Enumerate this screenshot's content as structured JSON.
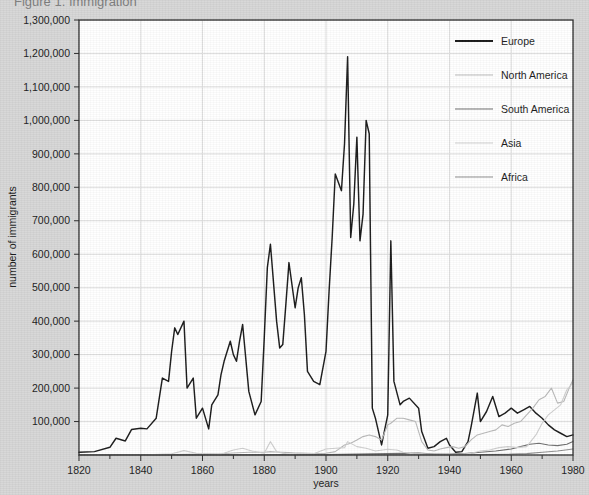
{
  "figure": {
    "clipped_title": "Figure 1.  Immigration",
    "background_color": "#d6d6d6",
    "plot_background_color": "#ffffff",
    "grid_color": "#dcdcdc",
    "axis_color": "#2b2b2b"
  },
  "axes": {
    "x": {
      "label": "years",
      "min": 1820,
      "max": 1980,
      "major_step": 20,
      "minor_step": 10,
      "ticks": [
        1820,
        1840,
        1860,
        1880,
        1900,
        1920,
        1940,
        1960,
        1980
      ],
      "tick_labels": [
        "1820",
        "1840",
        "1860",
        "1880",
        "1900",
        "1920",
        "1940",
        "1960",
        "1980"
      ]
    },
    "y": {
      "label": "number of immigrants",
      "min": 0,
      "max": 1300000,
      "step": 100000,
      "ticks": [
        100000,
        200000,
        300000,
        400000,
        500000,
        600000,
        700000,
        800000,
        900000,
        1000000,
        1100000,
        1200000,
        1300000
      ],
      "tick_labels": [
        "100,000",
        "200,000",
        "300,000",
        "400,000",
        "500,000",
        "600,000",
        "700,000",
        "800,000",
        "900,000",
        "1,000,000",
        "1,100,000",
        "1,200,000",
        "1,300,000"
      ]
    }
  },
  "legend": {
    "position": "top-right-inside",
    "items": [
      {
        "label": "Europe",
        "color": "#1a1a1a",
        "width": 2.1
      },
      {
        "label": "North America",
        "color": "#b9b9b9",
        "width": 1.2
      },
      {
        "label": "South America",
        "color": "#6e6e6e",
        "width": 1.2
      },
      {
        "label": "Asia",
        "color": "#cfcfcf",
        "width": 1.2
      },
      {
        "label": "Africa",
        "color": "#8e8e8e",
        "width": 1.2
      }
    ]
  },
  "chart_data": {
    "type": "line",
    "title": "Figure 1.  Immigration",
    "xlabel": "years",
    "ylabel": "number of immigrants",
    "xlim": [
      1820,
      1980
    ],
    "ylim": [
      0,
      1300000
    ],
    "grid": true,
    "legend_position": "top-right-inside",
    "series": [
      {
        "name": "Europe",
        "color": "#1a1a1a",
        "x": [
          1820,
          1825,
          1830,
          1832,
          1835,
          1837,
          1840,
          1842,
          1845,
          1847,
          1849,
          1850,
          1851,
          1852,
          1854,
          1855,
          1857,
          1858,
          1860,
          1862,
          1863,
          1865,
          1866,
          1867,
          1869,
          1870,
          1871,
          1872,
          1873,
          1875,
          1877,
          1879,
          1880,
          1881,
          1882,
          1884,
          1885,
          1886,
          1887,
          1888,
          1890,
          1891,
          1892,
          1893,
          1894,
          1896,
          1898,
          1900,
          1901,
          1902,
          1903,
          1905,
          1906,
          1907,
          1908,
          1909,
          1910,
          1911,
          1912,
          1913,
          1914,
          1915,
          1916,
          1918,
          1920,
          1921,
          1922,
          1924,
          1925,
          1927,
          1930,
          1931,
          1933,
          1935,
          1937,
          1939,
          1940,
          1942,
          1944,
          1946,
          1947,
          1949,
          1950,
          1952,
          1954,
          1956,
          1958,
          1960,
          1962,
          1964,
          1966,
          1968,
          1970,
          1972,
          1974,
          1976,
          1978,
          1980
        ],
        "y": [
          8000,
          10000,
          23000,
          50000,
          42000,
          76000,
          80000,
          78000,
          110000,
          230000,
          220000,
          310000,
          380000,
          360000,
          400000,
          200000,
          230000,
          110000,
          140000,
          78000,
          150000,
          180000,
          240000,
          280000,
          340000,
          300000,
          280000,
          340000,
          390000,
          190000,
          120000,
          160000,
          350000,
          560000,
          630000,
          400000,
          320000,
          330000,
          450000,
          575000,
          440000,
          500000,
          530000,
          420000,
          250000,
          220000,
          210000,
          310000,
          490000,
          650000,
          840000,
          790000,
          930000,
          1190000,
          650000,
          750000,
          950000,
          640000,
          720000,
          1000000,
          960000,
          140000,
          110000,
          30000,
          120000,
          640000,
          220000,
          150000,
          160000,
          170000,
          140000,
          70000,
          20000,
          25000,
          40000,
          50000,
          30000,
          8000,
          10000,
          40000,
          85000,
          185000,
          100000,
          130000,
          175000,
          115000,
          125000,
          140000,
          125000,
          135000,
          145000,
          125000,
          110000,
          90000,
          75000,
          65000,
          55000,
          60000
        ]
      },
      {
        "name": "North America",
        "color": "#b9b9b9",
        "x": [
          1820,
          1830,
          1840,
          1850,
          1860,
          1865,
          1870,
          1875,
          1880,
          1882,
          1884,
          1886,
          1888,
          1890,
          1892,
          1894,
          1896,
          1898,
          1900,
          1903,
          1906,
          1908,
          1910,
          1912,
          1914,
          1916,
          1918,
          1920,
          1921,
          1923,
          1925,
          1927,
          1929,
          1931,
          1933,
          1935,
          1937,
          1939,
          1941,
          1943,
          1945,
          1947,
          1949,
          1951,
          1953,
          1955,
          1957,
          1959,
          1961,
          1963,
          1965,
          1967,
          1969,
          1971,
          1973,
          1975,
          1977,
          1979,
          1980
        ],
        "y": [
          300,
          600,
          1000,
          1500,
          2500,
          3000,
          6000,
          8000,
          8000,
          10000,
          9000,
          8000,
          7000,
          6000,
          5500,
          5000,
          4500,
          4000,
          5000,
          10000,
          30000,
          35000,
          45000,
          55000,
          60000,
          55000,
          45000,
          90000,
          95000,
          110000,
          110000,
          105000,
          100000,
          40000,
          15000,
          12000,
          18000,
          22000,
          25000,
          20000,
          25000,
          45000,
          60000,
          65000,
          70000,
          75000,
          90000,
          85000,
          95000,
          100000,
          120000,
          140000,
          165000,
          175000,
          200000,
          155000,
          160000,
          205000,
          225000
        ]
      },
      {
        "name": "South America",
        "color": "#6e6e6e",
        "x": [
          1820,
          1840,
          1860,
          1880,
          1890,
          1900,
          1910,
          1920,
          1925,
          1930,
          1935,
          1940,
          1945,
          1950,
          1955,
          1960,
          1963,
          1966,
          1969,
          1972,
          1975,
          1978,
          1980
        ],
        "y": [
          100,
          200,
          400,
          800,
          1000,
          1200,
          2500,
          4000,
          5000,
          6000,
          2500,
          3000,
          4000,
          8000,
          12000,
          18000,
          25000,
          32000,
          35000,
          30000,
          28000,
          32000,
          40000
        ]
      },
      {
        "name": "Asia",
        "color": "#cfcfcf",
        "x": [
          1820,
          1830,
          1840,
          1850,
          1854,
          1858,
          1862,
          1866,
          1870,
          1873,
          1876,
          1880,
          1882,
          1884,
          1886,
          1888,
          1890,
          1892,
          1896,
          1900,
          1903,
          1906,
          1907,
          1910,
          1913,
          1916,
          1920,
          1923,
          1925,
          1928,
          1931,
          1935,
          1939,
          1943,
          1947,
          1950,
          1953,
          1956,
          1959,
          1962,
          1965,
          1968,
          1970,
          1972,
          1974,
          1976,
          1978,
          1980
        ],
        "y": [
          50,
          100,
          200,
          3500,
          13000,
          5000,
          4000,
          2500,
          15000,
          20000,
          12000,
          5000,
          40000,
          10000,
          5000,
          3000,
          3000,
          4000,
          4000,
          18000,
          20000,
          22000,
          40000,
          25000,
          20000,
          12000,
          17000,
          15000,
          8000,
          4000,
          3500,
          2000,
          2500,
          1500,
          5000,
          12000,
          15000,
          22000,
          25000,
          22000,
          25000,
          60000,
          95000,
          120000,
          135000,
          150000,
          195000,
          215000
        ]
      },
      {
        "name": "Africa",
        "color": "#8e8e8e",
        "x": [
          1820,
          1850,
          1880,
          1900,
          1920,
          1940,
          1950,
          1960,
          1965,
          1970,
          1975,
          1980
        ],
        "y": [
          30,
          60,
          150,
          300,
          800,
          500,
          1000,
          2500,
          4000,
          8000,
          12000,
          18000
        ]
      }
    ]
  }
}
